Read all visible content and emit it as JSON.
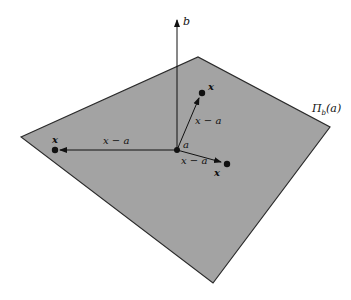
{
  "diagram": {
    "title": "",
    "colors": {
      "plane_fill": "#a3a3a3",
      "plane_edge": "#2a2a2a",
      "ink": "#111111",
      "background": "#ffffff"
    },
    "plane": {
      "label": "Π",
      "label_sub": "b",
      "label_arg": "(a)",
      "corners": [
        [
          21,
          137
        ],
        [
          198,
          57
        ],
        [
          330,
          127
        ],
        [
          213,
          283
        ]
      ]
    },
    "normal_vector": {
      "label": "b",
      "from": [
        177,
        150
      ],
      "to": [
        177,
        18
      ]
    },
    "origin_point": {
      "label": "a",
      "at": [
        177,
        150
      ]
    },
    "vectors": [
      {
        "label": "x − a",
        "from": [
          177,
          150
        ],
        "to": [
          201,
          93
        ],
        "endpoint_label": "x"
      },
      {
        "label": "x − a",
        "from": [
          177,
          150
        ],
        "to": [
          55,
          150
        ],
        "endpoint_label": "x"
      },
      {
        "label": "x − a",
        "from": [
          177,
          150
        ],
        "to": [
          226,
          164
        ],
        "endpoint_label": "x"
      }
    ]
  }
}
